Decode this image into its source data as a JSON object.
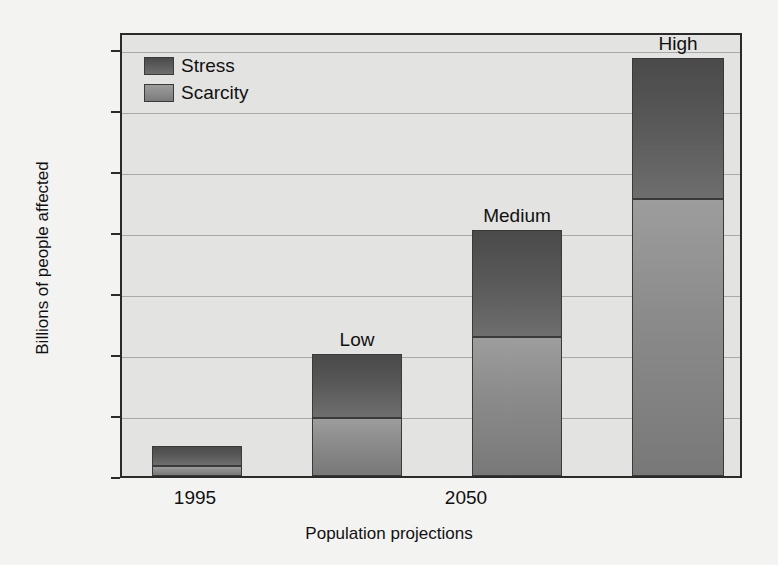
{
  "chart_data": {
    "type": "bar",
    "subtype": "stacked",
    "title": "",
    "xlabel": "Population projections",
    "ylabel": "Billions of people affected",
    "ylim": [
      0,
      7.3
    ],
    "yticks": [
      0,
      1,
      2,
      3,
      4,
      5,
      6,
      7
    ],
    "ytick_labels": [
      "0",
      "1",
      "2",
      "3",
      "4",
      "5",
      "6",
      "7"
    ],
    "grid": true,
    "grid_axis": "y",
    "legend_position": "upper left",
    "categories": [
      "1995",
      "Low",
      "Medium",
      "High"
    ],
    "xtick_labels": [
      "1995",
      "2050"
    ],
    "bar_annotations": [
      "",
      "Low",
      "Medium",
      "High"
    ],
    "series": [
      {
        "name": "Scarcity",
        "color": "#8c8c8c",
        "values": [
          0.17,
          0.95,
          2.28,
          4.55
        ]
      },
      {
        "name": "Stress",
        "color": "#585858",
        "values": [
          0.33,
          1.05,
          1.75,
          2.3
        ]
      }
    ],
    "totals": [
      0.5,
      2.0,
      4.03,
      6.85
    ]
  },
  "axes": {
    "y_title": "Billions of people affected",
    "x_title": "Population projections",
    "y_ticks": [
      "7",
      "6",
      "5",
      "4",
      "3",
      "2",
      "1",
      "0"
    ],
    "x_ticks": [
      {
        "label": "1995",
        "center_px": 195
      },
      {
        "label": "2050",
        "center_px": 466
      }
    ]
  },
  "legend": {
    "items": [
      {
        "label": "Stress",
        "swatch": "stress-swatch-icon"
      },
      {
        "label": "Scarcity",
        "swatch": "scarcity-swatch-icon"
      }
    ]
  },
  "bars": [
    {
      "name": "1995",
      "label": "",
      "left_px": 150,
      "width_px": 90,
      "scarcity": 0.17,
      "stress": 0.33
    },
    {
      "name": "low",
      "label": "Low",
      "left_px": 310,
      "width_px": 90,
      "scarcity": 0.95,
      "stress": 1.05
    },
    {
      "name": "medium",
      "label": "Medium",
      "left_px": 470,
      "width_px": 90,
      "scarcity": 2.28,
      "stress": 1.75
    },
    {
      "name": "high",
      "label": "High",
      "left_px": 630,
      "width_px": 92,
      "scarcity": 4.55,
      "stress": 2.3
    }
  ],
  "colors": {
    "background": "#f3f3f1",
    "plot_background": "#e3e3e1",
    "frame": "#2a2a2a",
    "gridline": "#a9a9a7",
    "stress": "#585858",
    "scarcity": "#8c8c8c"
  }
}
